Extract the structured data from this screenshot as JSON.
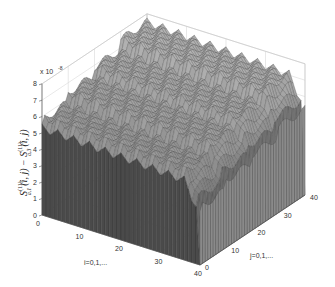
{
  "chart_data": {
    "type": "surface3d",
    "title": "",
    "xlabel": "i=0,1,...",
    "ylabel": "j=0,1,...",
    "zlabel": "S_{a,1}^{(11)}(i,j) − S_{a,3}^{(11)}(i,j)",
    "zlabel_main": "S",
    "zlabel_text": "S(11)a,1(i,j) − S(11)a,3(i,j)",
    "z_multiplier": "x 10",
    "z_exponent": "-8",
    "x_ticks": [
      0,
      10,
      20,
      30,
      40
    ],
    "y_ticks": [
      0,
      10,
      20,
      30,
      40
    ],
    "z_ticks": [
      0,
      1,
      2,
      3,
      4,
      5,
      6,
      7,
      8
    ],
    "xlim": [
      0,
      40
    ],
    "ylim": [
      0,
      40
    ],
    "zlim": [
      0,
      8
    ],
    "grid": true,
    "colormap": "gray",
    "surface_description": "Terraced surface rising from ~5.3 at front (j=0) to ~7.6 at back (j=40); ripples along i with period ~4; edge at i=40 drops to 0",
    "terraces": [
      {
        "j_range": [
          0,
          1
        ],
        "z": 5.3
      },
      {
        "j_range": [
          1,
          10
        ],
        "z": 5.8
      },
      {
        "j_range": [
          10,
          20
        ],
        "z": 6.4
      },
      {
        "j_range": [
          20,
          30
        ],
        "z": 6.9
      },
      {
        "j_range": [
          30,
          40
        ],
        "z": 7.5
      }
    ],
    "ripple_amplitude": 0.25,
    "ripple_period_i": 4
  },
  "axis_labels": {
    "x": "i=0,1,...",
    "y": "j=0,1,...",
    "z_sup": "(11)",
    "z_sub1": "a,1",
    "z_sub2": "a,3",
    "z_args": "(i, j)",
    "z_minus": "−",
    "multiplier": "x 10",
    "exponent": "-8"
  }
}
